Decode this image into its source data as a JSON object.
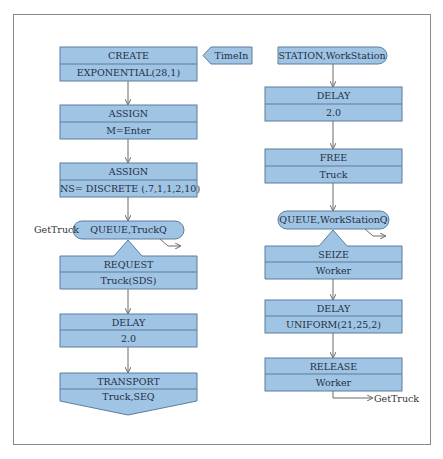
{
  "colors": {
    "block_fill": "#9fc4e4",
    "block_border": "#5d7d9c",
    "text": "#1f2f45",
    "connector": "#6b6b6b",
    "frame": "#8a8a8a"
  },
  "left_column": {
    "create": {
      "title": "CREATE",
      "param": "EXPONENTIAL(28,1)"
    },
    "timein_tag": "TimeIn",
    "assign1": {
      "title": "ASSIGN",
      "param": "M=Enter"
    },
    "assign2": {
      "title": "ASSIGN",
      "param": "NS= DISCRETE (.7,1,1,2,10)"
    },
    "queue": {
      "label": "QUEUE,TruckQ",
      "entry_label": "GetTruck"
    },
    "request": {
      "title": "REQUEST",
      "param": "Truck(SDS)"
    },
    "delay": {
      "title": "DELAY",
      "param": "2.0"
    },
    "transport": {
      "title": "TRANSPORT",
      "param": "Truck,SEQ"
    }
  },
  "right_column": {
    "station": {
      "label": "STATION,WorkStation"
    },
    "delay1": {
      "title": "DELAY",
      "param": "2.0"
    },
    "free": {
      "title": "FREE",
      "param": "Truck"
    },
    "queue": {
      "label": "QUEUE,WorkStationQ"
    },
    "seize": {
      "title": "SEIZE",
      "param": "Worker"
    },
    "delay2": {
      "title": "DELAY",
      "param": "UNIFORM(21,25,2)"
    },
    "release": {
      "title": "RELEASE",
      "param": "Worker"
    },
    "exit_label": "GetTruck"
  }
}
